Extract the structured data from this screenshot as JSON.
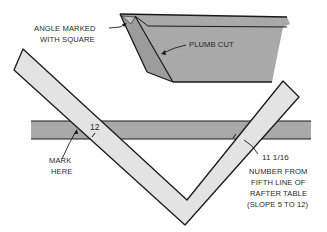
{
  "diagram": {
    "colors": {
      "background": "#ffffff",
      "lumber": "#a9a9a9",
      "lumber_dark": "#9a9a9a",
      "square": "#e3e3e3",
      "outline": "#1a1a1a",
      "text": "#2a2a2a"
    },
    "labels": {
      "angle_line1": "ANGLE MARKED",
      "angle_line2": "WITH SQUARE",
      "plumb_cut": "PLUMB CUT",
      "twelve": "12",
      "mark_line1": "MARK",
      "mark_line2": "HERE",
      "measurement": "11 1/16",
      "note_line1": "NUMBER FROM",
      "note_line2": "FIFTH LINE OF",
      "note_line3": "RAFTER TABLE",
      "note_line4": "(SLOPE 5 TO 12)"
    },
    "parts": [
      "rafter",
      "board",
      "framing-square"
    ]
  }
}
